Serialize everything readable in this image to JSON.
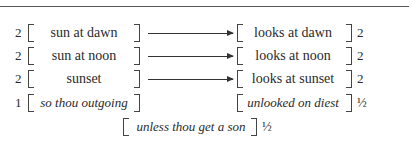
{
  "rows": [
    {
      "left_count": "2",
      "left_text": "sun at dawn",
      "right_text": "looks at dawn",
      "right_count": "2",
      "arrow": true,
      "italic": false
    },
    {
      "left_count": "2",
      "left_text": "sun at noon",
      "right_text": "looks at noon",
      "right_count": "2",
      "arrow": true,
      "italic": false
    },
    {
      "left_count": "2",
      "left_text": "sunset",
      "right_text": "looks at sunset",
      "right_count": "2",
      "arrow": true,
      "italic": false
    },
    {
      "left_count": "1",
      "left_text": "so thou outgoing",
      "right_text": "unlooked on diest",
      "right_count": "½",
      "arrow": false,
      "italic": true
    }
  ],
  "bottom": {
    "text": "unless thou get a son",
    "count": "½"
  }
}
